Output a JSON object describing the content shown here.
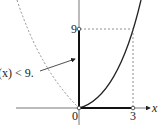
{
  "diagram": {
    "axis_labels": {
      "x": "x"
    },
    "ticks": {
      "origin": "0",
      "x_tick": "3",
      "y_tick": "9"
    },
    "annotation": "f(x) < 9.",
    "curves": [
      {
        "name": "parabola-right",
        "style": "solid",
        "equation": "y = x^2, x >= 0"
      },
      {
        "name": "parabola-left",
        "style": "dashed",
        "equation": "y = x^2, x < 0"
      }
    ],
    "highlighted_segments": [
      {
        "axis": "y",
        "from": 0,
        "to": 9
      },
      {
        "axis": "x",
        "from": 0,
        "to": 3
      }
    ],
    "guides": [
      {
        "style": "dashed",
        "from": [
          0,
          9
        ],
        "to": [
          3,
          9
        ]
      },
      {
        "style": "dashed",
        "from": [
          3,
          9
        ],
        "to": [
          3,
          0
        ]
      }
    ],
    "colors": {
      "ink": "#222222",
      "dashed": "#777777",
      "background": "#ffffff"
    }
  }
}
